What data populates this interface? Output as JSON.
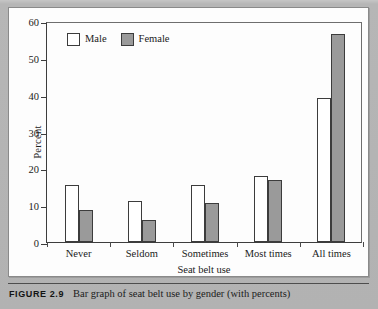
{
  "figure": {
    "caption_label": "FIGURE 2.9",
    "caption_text": "Bar graph of seat belt use by gender (with percents)"
  },
  "legend": {
    "entries": [
      {
        "label": "Male",
        "swatch": "white-square-icon",
        "color": "#ffffff"
      },
      {
        "label": "Female",
        "swatch": "gray-square-icon",
        "color": "#9a9a9a"
      }
    ]
  },
  "axes": {
    "y_title": "Percent",
    "x_title": "Seat belt use",
    "y_ticks": [
      "0",
      "10",
      "20",
      "30",
      "40",
      "50",
      "60"
    ]
  },
  "chart_data": {
    "type": "bar",
    "title": "Bar graph of seat belt use by gender (with percents)",
    "xlabel": "Seat belt use",
    "ylabel": "Percent",
    "ylim": [
      0,
      60
    ],
    "ytick_step": 10,
    "yticks": [
      0,
      10,
      20,
      30,
      40,
      50,
      60
    ],
    "grid": false,
    "legend_position": "top-left inside plot",
    "categories": [
      "Never",
      "Seldom",
      "Sometimes",
      "Most times",
      "All times"
    ],
    "series": [
      {
        "name": "Male",
        "color": "#ffffff",
        "edge_color": "#3c3c3c",
        "values": [
          15.5,
          11.1,
          15.5,
          18.0,
          39.0
        ]
      },
      {
        "name": "Female",
        "color": "#9a9a9a",
        "edge_color": "#3c3c3c",
        "values": [
          8.7,
          6.0,
          10.7,
          16.8,
          56.4
        ]
      }
    ]
  }
}
